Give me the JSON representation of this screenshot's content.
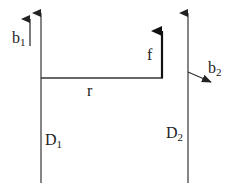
{
  "diagram": {
    "colors": {
      "line": "#333333",
      "text": "#222222",
      "background": "#ffffff"
    },
    "labels": {
      "b1": {
        "base": "b",
        "sub": "1"
      },
      "b2": {
        "base": "b",
        "sub": "2"
      },
      "f": "f",
      "r": "r",
      "D1": {
        "base": "D",
        "sub": "1"
      },
      "D2": {
        "base": "D",
        "sub": "2"
      }
    },
    "elements": [
      {
        "id": "D1",
        "type": "vertical-line-with-arrow",
        "description": "Dislocation line D1 pointing up"
      },
      {
        "id": "D2",
        "type": "vertical-line-with-arrow",
        "description": "Dislocation line D2 pointing up"
      },
      {
        "id": "b1",
        "type": "arrow",
        "description": "Burgers vector b1 pointing up, parallel to D1"
      },
      {
        "id": "b2",
        "type": "arrow",
        "description": "Burgers vector b2 pointing right-down from D2"
      },
      {
        "id": "r",
        "type": "line",
        "description": "Separation distance r between D1 and force point"
      },
      {
        "id": "f",
        "type": "arrow",
        "description": "Force vector f pointing up, bold"
      }
    ]
  }
}
